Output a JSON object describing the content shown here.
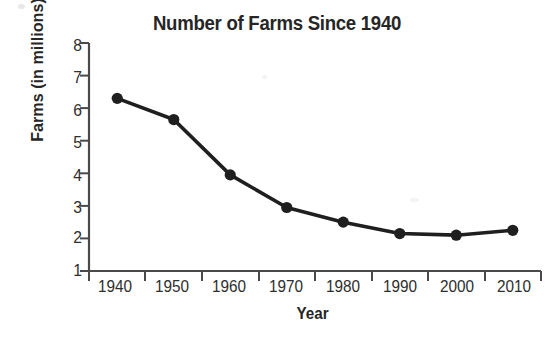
{
  "chart_data": {
    "type": "line",
    "title": "Number of Farms Since 1940",
    "xlabel": "Year",
    "ylabel": "Farms (in millions)",
    "categories": [
      "1940",
      "1950",
      "1960",
      "1970",
      "1980",
      "1990",
      "2000",
      "2010"
    ],
    "values": [
      6.3,
      5.65,
      3.95,
      2.95,
      2.5,
      2.15,
      2.1,
      2.25
    ],
    "series": [
      {
        "name": "Farms (in millions)",
        "values": [
          6.3,
          5.65,
          3.95,
          2.95,
          2.5,
          2.15,
          2.1,
          2.25
        ]
      }
    ],
    "ylim": [
      1,
      8
    ],
    "yticks": [
      "8",
      "7",
      "6",
      "5",
      "4",
      "3",
      "2",
      "1"
    ],
    "ytick_values": [
      8,
      7,
      6,
      5,
      4,
      3,
      2,
      1
    ],
    "grid": false,
    "legend": "none",
    "line_color": "#1f1f1f",
    "marker": "circle",
    "marker_color": "#1f1f1f",
    "background_color": "#ffffff"
  },
  "axis": {
    "y_title": "Farms (in millions)",
    "x_title": "Year"
  }
}
